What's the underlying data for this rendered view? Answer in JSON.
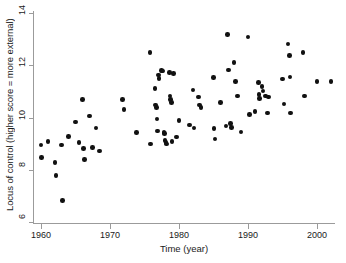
{
  "chart_data": {
    "type": "scatter",
    "title": "",
    "xlabel": "Time (year)",
    "ylabel": "Locus of control (higher score = more external)",
    "xlim": [
      1959,
      2003
    ],
    "ylim": [
      6,
      14
    ],
    "xticks": [
      1960,
      1970,
      1980,
      1990,
      2000
    ],
    "yticks": [
      6,
      8,
      10,
      12,
      14
    ],
    "grid": false,
    "legend": null,
    "marker": "filled-circle",
    "marker_color": "#111111",
    "points": [
      {
        "x": 1960.0,
        "y": 8.95
      },
      {
        "x": 1960.1,
        "y": 8.48
      },
      {
        "x": 1961.0,
        "y": 9.08
      },
      {
        "x": 1962.0,
        "y": 8.28
      },
      {
        "x": 1962.2,
        "y": 7.78
      },
      {
        "x": 1963.0,
        "y": 8.95
      },
      {
        "x": 1963.1,
        "y": 6.83
      },
      {
        "x": 1964.0,
        "y": 9.28
      },
      {
        "x": 1965.0,
        "y": 9.82
      },
      {
        "x": 1965.5,
        "y": 9.05
      },
      {
        "x": 1966.0,
        "y": 10.7
      },
      {
        "x": 1966.2,
        "y": 8.82
      },
      {
        "x": 1966.3,
        "y": 8.4
      },
      {
        "x": 1967.0,
        "y": 10.05
      },
      {
        "x": 1967.5,
        "y": 8.85
      },
      {
        "x": 1968.0,
        "y": 9.6
      },
      {
        "x": 1968.5,
        "y": 8.72
      },
      {
        "x": 1971.8,
        "y": 10.68
      },
      {
        "x": 1972.0,
        "y": 10.3
      },
      {
        "x": 1973.8,
        "y": 9.42
      },
      {
        "x": 1975.8,
        "y": 12.48
      },
      {
        "x": 1975.9,
        "y": 8.98
      },
      {
        "x": 1976.5,
        "y": 11.12
      },
      {
        "x": 1976.6,
        "y": 10.48
      },
      {
        "x": 1976.7,
        "y": 10.38
      },
      {
        "x": 1976.8,
        "y": 9.95
      },
      {
        "x": 1976.9,
        "y": 9.48
      },
      {
        "x": 1977.0,
        "y": 11.62
      },
      {
        "x": 1977.1,
        "y": 11.5
      },
      {
        "x": 1977.5,
        "y": 11.8
      },
      {
        "x": 1977.6,
        "y": 11.78
      },
      {
        "x": 1977.8,
        "y": 9.42
      },
      {
        "x": 1977.9,
        "y": 9.38
      },
      {
        "x": 1978.0,
        "y": 9.12
      },
      {
        "x": 1978.1,
        "y": 9.05
      },
      {
        "x": 1978.2,
        "y": 8.98
      },
      {
        "x": 1978.6,
        "y": 11.72
      },
      {
        "x": 1978.7,
        "y": 10.82
      },
      {
        "x": 1978.8,
        "y": 10.68
      },
      {
        "x": 1978.9,
        "y": 10.58
      },
      {
        "x": 1979.0,
        "y": 9.08
      },
      {
        "x": 1979.2,
        "y": 11.68
      },
      {
        "x": 1979.6,
        "y": 9.25
      },
      {
        "x": 1980.0,
        "y": 9.88
      },
      {
        "x": 1981.5,
        "y": 9.72
      },
      {
        "x": 1982.0,
        "y": 11.05
      },
      {
        "x": 1982.2,
        "y": 9.6
      },
      {
        "x": 1982.8,
        "y": 10.78
      },
      {
        "x": 1983.0,
        "y": 10.48
      },
      {
        "x": 1983.2,
        "y": 10.38
      },
      {
        "x": 1985.0,
        "y": 11.52
      },
      {
        "x": 1985.1,
        "y": 9.58
      },
      {
        "x": 1985.2,
        "y": 9.18
      },
      {
        "x": 1986.0,
        "y": 10.58
      },
      {
        "x": 1986.8,
        "y": 9.68
      },
      {
        "x": 1987.0,
        "y": 13.18
      },
      {
        "x": 1987.2,
        "y": 11.82
      },
      {
        "x": 1987.5,
        "y": 9.78
      },
      {
        "x": 1987.6,
        "y": 9.62
      },
      {
        "x": 1988.0,
        "y": 12.1
      },
      {
        "x": 1988.2,
        "y": 11.38
      },
      {
        "x": 1988.5,
        "y": 10.82
      },
      {
        "x": 1989.0,
        "y": 9.45
      },
      {
        "x": 1990.0,
        "y": 13.08
      },
      {
        "x": 1990.2,
        "y": 10.12
      },
      {
        "x": 1991.0,
        "y": 10.22
      },
      {
        "x": 1991.5,
        "y": 11.35
      },
      {
        "x": 1991.6,
        "y": 10.88
      },
      {
        "x": 1991.7,
        "y": 10.72
      },
      {
        "x": 1992.0,
        "y": 11.18
      },
      {
        "x": 1992.2,
        "y": 11.02
      },
      {
        "x": 1992.5,
        "y": 10.82
      },
      {
        "x": 1992.8,
        "y": 10.18
      },
      {
        "x": 1993.0,
        "y": 10.78
      },
      {
        "x": 1995.0,
        "y": 11.48
      },
      {
        "x": 1995.2,
        "y": 10.52
      },
      {
        "x": 1995.8,
        "y": 12.82
      },
      {
        "x": 1996.0,
        "y": 12.38
      },
      {
        "x": 1996.1,
        "y": 11.55
      },
      {
        "x": 1996.2,
        "y": 10.18
      },
      {
        "x": 1998.0,
        "y": 12.48
      },
      {
        "x": 1998.2,
        "y": 10.82
      },
      {
        "x": 2000.0,
        "y": 11.38
      },
      {
        "x": 2002.0,
        "y": 11.38
      }
    ]
  },
  "axes": {
    "y_title": "Locus of control (higher score = more external)",
    "x_title": "Time (year)",
    "y_tick_labels": [
      "6",
      "8",
      "10",
      "12",
      "14"
    ],
    "x_tick_labels": [
      "1960",
      "1970",
      "1980",
      "1990",
      "2000"
    ]
  }
}
